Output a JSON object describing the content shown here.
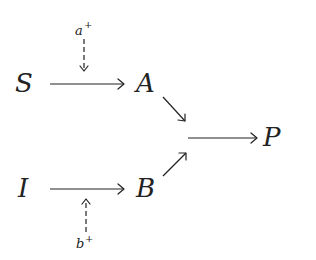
{
  "diagram": {
    "nodes": {
      "S": {
        "label": "S",
        "x": 15,
        "y": 92
      },
      "A": {
        "label": "A",
        "x": 135,
        "y": 92
      },
      "I": {
        "label": "I",
        "x": 18,
        "y": 197
      },
      "B": {
        "label": "B",
        "x": 135,
        "y": 197
      },
      "P": {
        "label": "P",
        "x": 263,
        "y": 146
      }
    },
    "modulators": {
      "a": {
        "base": "a",
        "sign": "+",
        "x": 75,
        "y": 34
      },
      "b": {
        "base": "b",
        "sign": "+",
        "x": 76,
        "y": 248
      }
    },
    "edges": [
      {
        "from": "S",
        "to": "A",
        "style": "solid"
      },
      {
        "from": "I",
        "to": "B",
        "style": "solid"
      },
      {
        "from": "A",
        "to": "junction",
        "style": "solid"
      },
      {
        "from": "B",
        "to": "junction",
        "style": "solid"
      },
      {
        "from": "junction",
        "to": "P",
        "style": "solid"
      },
      {
        "from": "a+",
        "to": "S→A",
        "style": "dashed"
      },
      {
        "from": "b+",
        "to": "I→B",
        "style": "dashed"
      }
    ],
    "colors": {
      "ink": "#222222",
      "background": "#ffffff"
    }
  }
}
